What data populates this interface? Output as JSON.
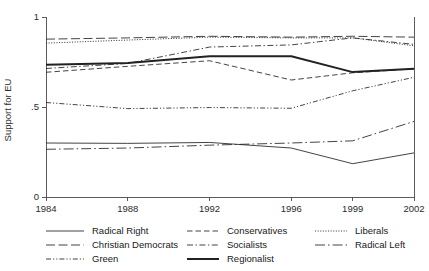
{
  "chart_data": {
    "type": "line",
    "title": "",
    "xlabel": "",
    "ylabel": "Support for EU",
    "x": [
      1984,
      1988,
      1992,
      1996,
      1999,
      2002
    ],
    "xtick_labels": [
      "1984",
      "1988",
      "1992",
      "1996",
      "1999",
      "2002"
    ],
    "ytick_labels": [
      "0",
      ".5",
      "1"
    ],
    "ytick_values": [
      0,
      0.5,
      1
    ],
    "xlim": [
      1984,
      2002
    ],
    "ylim": [
      0,
      1
    ],
    "grid": false,
    "legend_position": "below",
    "legend_columns": 3,
    "series": [
      {
        "name": "Radical Right",
        "style": "solid",
        "values": [
          0.3,
          0.298,
          0.303,
          0.272,
          0.185,
          0.245
        ]
      },
      {
        "name": "Christian Democrats",
        "style": "long-dash",
        "values": [
          0.877,
          0.884,
          0.893,
          0.888,
          0.893,
          0.888
        ]
      },
      {
        "name": "Green",
        "style": "dash-dot-dot",
        "values": [
          0.525,
          0.491,
          0.497,
          0.493,
          0.59,
          0.665
        ]
      },
      {
        "name": "Conservatives",
        "style": "dash",
        "values": [
          0.693,
          0.726,
          0.757,
          0.65,
          0.69,
          0.712
        ]
      },
      {
        "name": "Socialists",
        "style": "dash-dot",
        "values": [
          0.714,
          0.742,
          0.833,
          0.845,
          0.884,
          0.848
        ]
      },
      {
        "name": "Regionalist",
        "style": "thick-solid",
        "values": [
          0.735,
          0.744,
          0.782,
          0.782,
          0.694,
          0.712
        ]
      },
      {
        "name": "Liberals",
        "style": "dotted",
        "values": [
          0.855,
          0.872,
          0.888,
          0.884,
          0.884,
          0.84
        ]
      },
      {
        "name": "Radical Left",
        "style": "long-dash-dot",
        "values": [
          0.265,
          0.272,
          0.288,
          0.3,
          0.312,
          0.42
        ]
      }
    ],
    "legend_entries": [
      {
        "label": "Radical Right",
        "style": "solid",
        "column": 0,
        "row": 0
      },
      {
        "label": "Christian Democrats",
        "style": "long-dash",
        "column": 0,
        "row": 1
      },
      {
        "label": "Green",
        "style": "dash-dot-dot",
        "column": 0,
        "row": 2
      },
      {
        "label": "Conservatives",
        "style": "dash",
        "column": 1,
        "row": 0
      },
      {
        "label": "Socialists",
        "style": "dash-dot",
        "column": 1,
        "row": 1
      },
      {
        "label": "Regionalist",
        "style": "thick-solid",
        "column": 1,
        "row": 2
      },
      {
        "label": "Liberals",
        "style": "dotted",
        "column": 2,
        "row": 0
      },
      {
        "label": "Radical Left",
        "style": "long-dash-dot",
        "column": 2,
        "row": 1
      }
    ],
    "colors": {
      "line": "#222222",
      "axis": "#4a4a4a",
      "text": "#1a1a1a",
      "background": "#ffffff"
    }
  }
}
